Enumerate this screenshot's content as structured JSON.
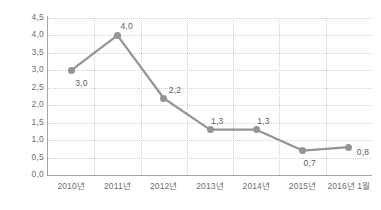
{
  "chart_data": {
    "type": "line",
    "title": "",
    "xlabel": "",
    "ylabel": "",
    "categories": [
      "2010년",
      "2011년",
      "2012년",
      "2013년",
      "2014년",
      "2015년",
      "2016년 1월"
    ],
    "values": [
      3.0,
      4.0,
      2.2,
      1.3,
      1.3,
      0.7,
      0.8
    ],
    "point_labels": [
      "3,0",
      "4,0",
      "2,2",
      "1,3",
      "1,3",
      "0,7",
      "0,8"
    ],
    "ylim": [
      0.0,
      4.5
    ],
    "ytick_values": [
      0.0,
      0.5,
      1.0,
      1.5,
      2.0,
      2.5,
      3.0,
      3.5,
      4.0,
      4.5
    ],
    "ytick_labels": [
      "0,0",
      "0,5",
      "1,0",
      "1,5",
      "2,0",
      "2,5",
      "3,0",
      "3,5",
      "4,0",
      "4,5"
    ],
    "grid": {
      "horizontal": true,
      "vertical": true,
      "style": "dotted"
    },
    "legend": {
      "visible": false,
      "position": "none"
    },
    "decimal_separator": ",",
    "series_color": "#949494",
    "grid_color": "#d2d2d2",
    "axis_color": "#a6a6a6",
    "label_color": "#6e6e6e",
    "background_color": "#ffffff",
    "label_offsets": [
      {
        "dx": 4,
        "dy": 9
      },
      {
        "dx": 3,
        "dy": -13
      },
      {
        "dx": 5,
        "dy": -12
      },
      {
        "dx": 1,
        "dy": -13
      },
      {
        "dx": 1,
        "dy": -13
      },
      {
        "dx": 1,
        "dy": 8
      },
      {
        "dx": 8,
        "dy": 1
      }
    ]
  }
}
